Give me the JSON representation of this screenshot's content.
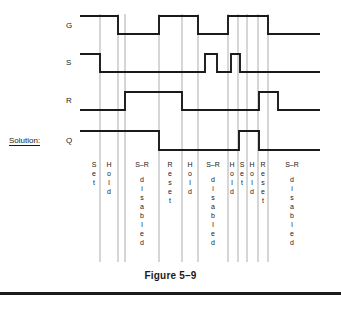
{
  "figure": {
    "caption": "Figure 5–9",
    "solution_label": "Solution:",
    "signals": [
      {
        "name": "G",
        "label": "G",
        "y": 25
      },
      {
        "name": "S",
        "label": "S",
        "y": 62
      },
      {
        "name": "R",
        "label": "R",
        "y": 100
      },
      {
        "name": "Q",
        "label": "Q",
        "y": 140
      }
    ]
  },
  "chart_data": {
    "type": "line",
    "title": "Figure 5–9",
    "xlabel": "",
    "ylabel": "",
    "x_range": [
      80,
      320
    ],
    "levels": {
      "low": 0,
      "high": 1
    },
    "series": [
      {
        "name": "G",
        "label": "G",
        "y_high": 16,
        "y_low": 34,
        "start_level": "high",
        "transitions": [
          {
            "x": 118,
            "to": "low"
          },
          {
            "x": 159,
            "to": "high"
          },
          {
            "x": 198,
            "to": "low"
          },
          {
            "x": 228,
            "to": "high"
          },
          {
            "x": 268,
            "to": "low"
          }
        ]
      },
      {
        "name": "S",
        "label": "S",
        "y_high": 54,
        "y_low": 72,
        "start_level": "high",
        "transitions": [
          {
            "x": 100,
            "to": "low"
          },
          {
            "x": 205,
            "to": "high"
          },
          {
            "x": 217,
            "to": "low"
          },
          {
            "x": 231,
            "to": "high"
          },
          {
            "x": 240,
            "to": "low"
          }
        ]
      },
      {
        "name": "R",
        "label": "R",
        "y_high": 92,
        "y_low": 110,
        "start_level": "low",
        "transitions": [
          {
            "x": 125,
            "to": "high"
          },
          {
            "x": 182,
            "to": "low"
          },
          {
            "x": 259,
            "to": "high"
          },
          {
            "x": 278,
            "to": "low"
          }
        ]
      },
      {
        "name": "Q",
        "label": "Q",
        "y_high": 131,
        "y_low": 150,
        "start_level": "high",
        "transitions": [
          {
            "x": 159,
            "to": "low"
          },
          {
            "x": 239,
            "to": "high"
          },
          {
            "x": 259,
            "to": "low"
          }
        ]
      }
    ],
    "dividers": [
      100,
      118,
      125,
      159,
      182,
      198,
      228,
      238,
      247,
      258,
      268
    ],
    "phases": [
      {
        "id": "p1",
        "words": [
          "Set"
        ],
        "x_start": 88,
        "x_end": 100,
        "center": 94
      },
      {
        "id": "p2",
        "words": [
          "Hold"
        ],
        "x_start": 100,
        "x_end": 118,
        "center": 109
      },
      {
        "id": "p3",
        "words": [
          "S–R",
          "disabled"
        ],
        "x_start": 125,
        "x_end": 159,
        "center": 142
      },
      {
        "id": "p4",
        "words": [
          "Reset"
        ],
        "x_start": 159,
        "x_end": 182,
        "center": 170
      },
      {
        "id": "p5",
        "words": [
          "Hold"
        ],
        "x_start": 182,
        "x_end": 198,
        "center": 190
      },
      {
        "id": "p6",
        "words": [
          "S–R",
          "disabled"
        ],
        "x_start": 198,
        "x_end": 228,
        "center": 213
      },
      {
        "id": "p7",
        "words": [
          "Hold"
        ],
        "x_start": 228,
        "x_end": 238,
        "center": 232
      },
      {
        "id": "p8",
        "words": [
          "Set"
        ],
        "x_start": 238,
        "x_end": 247,
        "center": 242
      },
      {
        "id": "p9",
        "words": [
          "Hold"
        ],
        "x_start": 247,
        "x_end": 258,
        "center": 252
      },
      {
        "id": "p10",
        "words": [
          "Reset"
        ],
        "x_start": 258,
        "x_end": 268,
        "center": 263
      },
      {
        "id": "p11",
        "words": [
          "S–R",
          "disabled"
        ],
        "x_start": 268,
        "x_end": 320,
        "center": 292
      }
    ],
    "grid": true,
    "legend": "none",
    "colors": {
      "line": "#1a1a1a",
      "divider": "#8a8a8a",
      "background": "#ffffff"
    }
  }
}
